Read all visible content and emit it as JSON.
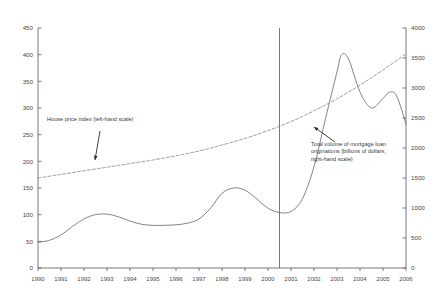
{
  "chart_data": {
    "type": "line",
    "title": "",
    "subtitle": "",
    "xlabel": "",
    "ylabel": "",
    "grid": false,
    "legend_position": "inline-annotations",
    "x_tick_labels": [
      "1990",
      "1991",
      "1992",
      "1993",
      "1994",
      "1995",
      "1996",
      "1997",
      "1998",
      "1999",
      "2000",
      "2001",
      "2002",
      "2003",
      "2004",
      "2005",
      "2006"
    ],
    "xlim": [
      1990,
      2006
    ],
    "left_axis": {
      "label": "House price index (left-hand scale)",
      "ylim": [
        0,
        450
      ],
      "ticks": [
        0,
        50,
        100,
        150,
        200,
        250,
        300,
        350,
        400,
        450
      ]
    },
    "right_axis": {
      "label": "Total volume of mortgage loan originations (billions of dollars, right-hand scale)",
      "ylim": [
        0,
        4000
      ],
      "ticks": [
        0,
        500,
        1000,
        1500,
        2000,
        2500,
        3000,
        3500,
        4000
      ]
    },
    "series": [
      {
        "name": "House price index (left-hand scale)",
        "axis": "left",
        "style": "solid",
        "color": "#6e6e6e",
        "x": [
          1990.0,
          1990.5,
          1991.0,
          1991.5,
          1992.0,
          1992.5,
          1993.0,
          1993.5,
          1994.0,
          1994.5,
          1995.0,
          1995.5,
          1996.0,
          1996.5,
          1997.0,
          1997.5,
          1998.0,
          1998.5,
          1999.0,
          1999.5,
          2000.0,
          2000.5,
          2001.0,
          2001.5,
          2002.0,
          2002.5,
          2003.0,
          2003.2,
          2003.5,
          2004.0,
          2004.5,
          2005.0,
          2005.3,
          2005.6,
          2006.0
        ],
        "y": [
          48,
          52,
          62,
          78,
          92,
          100,
          101,
          96,
          88,
          82,
          80,
          80,
          81,
          84,
          92,
          112,
          140,
          150,
          146,
          130,
          112,
          104,
          106,
          130,
          190,
          280,
          368,
          400,
          392,
          330,
          300,
          318,
          330,
          322,
          270
        ]
      },
      {
        "name": "Total volume of mortgage loan originations (billions of dollars, right-hand scale)",
        "axis": "right",
        "style": "dashed",
        "color": "#8a8a8a",
        "x": [
          1990,
          1991,
          1992,
          1993,
          1994,
          1995,
          1996,
          1997,
          1998,
          1999,
          2000,
          2001,
          2002,
          2003,
          2004,
          2005,
          2006
        ],
        "y": [
          1500,
          1560,
          1620,
          1680,
          1740,
          1800,
          1870,
          1950,
          2050,
          2160,
          2290,
          2440,
          2620,
          2820,
          3050,
          3300,
          3570
        ]
      }
    ],
    "reference_lines": [
      {
        "name": "vertical-marker-2000",
        "orientation": "vertical",
        "x": 2000.5,
        "color": "#555555"
      }
    ],
    "annotations": [
      {
        "name": "house-price-index-annotation",
        "text": "House price index (left-hand scale)",
        "lines": [
          "House price index (left-hand scale)"
        ],
        "text_x": 47,
        "text_y": 121,
        "arrow_from_x": 100,
        "arrow_from_y": 131,
        "arrow_to_x": 95,
        "arrow_to_y": 160
      },
      {
        "name": "mortgage-originations-annotation",
        "text": "Total volume of mortgage loan originations (billions of dollars, right-hand scale)",
        "lines": [
          "Total volume of mortgage loan",
          "originations (billions of dollars,",
          "right-hand  scale)"
        ],
        "text_x": 311,
        "text_y": 146,
        "arrow_from_x": 335,
        "arrow_from_y": 142,
        "arrow_to_x": 314,
        "arrow_to_y": 127
      }
    ]
  },
  "axis_colors": {
    "axis_line": "#555555",
    "tick_text": "#4a4a4a",
    "series_solid": "#6e6e6e",
    "series_dashed": "#8a8a8a",
    "background": "#ffffff"
  }
}
